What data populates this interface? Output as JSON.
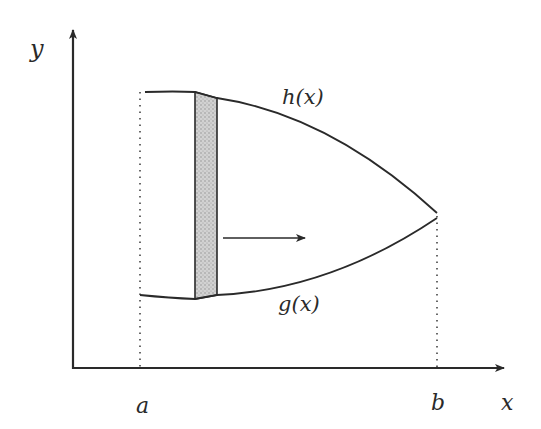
{
  "diagram": {
    "type": "area-between-curves",
    "labels": {
      "y_axis": "y",
      "x_axis": "x",
      "upper_curve": "h(x)",
      "lower_curve": "g(x)",
      "left_bound": "a",
      "right_bound": "b"
    },
    "colors": {
      "ink": "#2a2a2a",
      "strip_fill": "#c8c8c8",
      "background": "#ffffff"
    },
    "elements": [
      {
        "name": "y-axis",
        "style": "solid with arrowhead"
      },
      {
        "name": "x-axis",
        "style": "solid with arrowhead"
      },
      {
        "name": "upper-curve",
        "label": "h(x)"
      },
      {
        "name": "lower-curve",
        "label": "g(x)"
      },
      {
        "name": "vertical-strip",
        "style": "shaded stippled rectangle"
      },
      {
        "name": "direction-arrow",
        "direction": "right"
      },
      {
        "name": "bound-line-a",
        "style": "dotted"
      },
      {
        "name": "bound-line-b",
        "style": "dotted"
      }
    ]
  }
}
